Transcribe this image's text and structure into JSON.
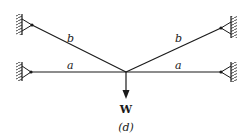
{
  "figure": {
    "caption": "(d)",
    "load_label": "W",
    "members": [
      {
        "id": "b-left",
        "label": "b"
      },
      {
        "id": "a-left",
        "label": "a"
      },
      {
        "id": "b-right",
        "label": "b"
      },
      {
        "id": "a-right",
        "label": "a"
      }
    ],
    "supports": [
      "upper-left-wall",
      "lower-left-wall",
      "upper-right-wall",
      "lower-right-wall"
    ],
    "colors": {
      "line": "#1a1a1a",
      "background": "#ffffff"
    }
  }
}
